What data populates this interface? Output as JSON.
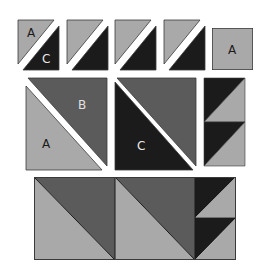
{
  "colors": {
    "light": "#a9a9a9",
    "medium": "#5b5b5b",
    "dark": "#1b1b1b",
    "outline": "#3a3a3a",
    "gap": "#ffffff"
  },
  "labels": {
    "top_first_tile_top": "A",
    "top_first_tile_bottom": "C",
    "top_square": "A",
    "middle_left_top": "B",
    "middle_left_bottom": "A",
    "middle_center_bottom": "C"
  },
  "top_row": {
    "half_square_tiles": 4,
    "square_label": "A"
  },
  "middle_row": {
    "pieces": [
      "large-half-square-A-B",
      "large-half-square-C-B",
      "flying-geese-strip"
    ]
  },
  "bottom_row": {
    "assembled_block": "two large half-square triangles plus strip of two small half-square triangles"
  }
}
